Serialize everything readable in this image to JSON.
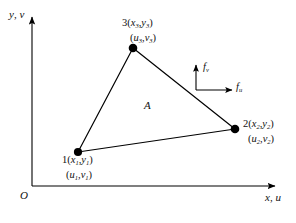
{
  "figure": {
    "type": "finite-element-triangle-diagram",
    "background_color": "#ffffff",
    "line_color": "#000000"
  },
  "axes": {
    "y_label": "y, v",
    "y_label_text": "y, v",
    "x_label": "x, u",
    "x_label_text": "x, u",
    "origin_label": "O"
  },
  "nodes": [
    {
      "id": "1",
      "xy_label": "1(x1,y1)",
      "uv_label": "(u1,v1)",
      "number": "1",
      "x_sub": "1",
      "y_sub": "1",
      "u_sub": "1",
      "v_sub": "1"
    },
    {
      "id": "2",
      "xy_label": "2(x2,y2)",
      "uv_label": "(u2,v2)",
      "number": "2",
      "x_sub": "2",
      "y_sub": "2",
      "u_sub": "2",
      "v_sub": "2"
    },
    {
      "id": "3",
      "xy_label": "3(x3,y3)",
      "uv_label": "(u3,v3)",
      "number": "3",
      "x_sub": "3",
      "y_sub": "3",
      "u_sub": "3",
      "v_sub": "3"
    }
  ],
  "area": {
    "label": "A"
  },
  "forces": [
    {
      "id": "force-v",
      "label": "fv",
      "symbol": "f",
      "subscript": "v",
      "direction": "up"
    },
    {
      "id": "force-u",
      "label": "fu",
      "symbol": "f",
      "subscript": "u",
      "direction": "right"
    }
  ]
}
